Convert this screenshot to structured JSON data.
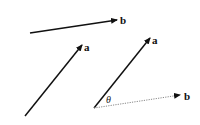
{
  "diagram": {
    "vectors": [
      {
        "id": "b-top",
        "label": "b",
        "style": "solid",
        "x1": 30,
        "y1": 33,
        "x2": 117,
        "y2": 20,
        "lx": 120,
        "ly": 24
      },
      {
        "id": "a-left",
        "label": "a",
        "style": "solid",
        "x1": 25,
        "y1": 116,
        "x2": 82,
        "y2": 45,
        "lx": 84,
        "ly": 51
      },
      {
        "id": "a-right",
        "label": "a",
        "style": "solid",
        "x1": 94,
        "y1": 108,
        "x2": 150,
        "y2": 38,
        "lx": 152,
        "ly": 44
      },
      {
        "id": "b-dotted",
        "label": "b",
        "style": "dotted",
        "x1": 94,
        "y1": 108,
        "x2": 180,
        "y2": 95,
        "lx": 184,
        "ly": 100
      }
    ],
    "angle": {
      "label": "θ",
      "x": 106,
      "y": 103
    }
  }
}
